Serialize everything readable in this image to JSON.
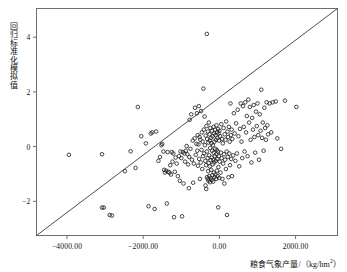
{
  "figure": {
    "background_color": "#ffffff",
    "frame_color": "#6f6f6f",
    "marker_color": "#1a1a1a",
    "line_color": "#3a3a3a"
  },
  "chart_data": {
    "type": "scatter",
    "title": "",
    "xlabel": "粮食气象产量/（kg/hm²）",
    "ylabel": "回归标准化模拟值",
    "xlim": [
      -4800,
      3100
    ],
    "ylim": [
      -3.25,
      5.05
    ],
    "grid": false,
    "legend": null,
    "xticks": [
      -4000,
      -2000,
      0,
      2000
    ],
    "xtick_labels": [
      "-4000.00",
      "-2000.00",
      "0.00",
      "2000.00"
    ],
    "yticks": [
      -2,
      0,
      2,
      4
    ],
    "ytick_labels": [
      "-2",
      "0",
      "2",
      "4"
    ],
    "reference_line": {
      "name": "1:1 diagonal reference line",
      "x": [
        -4800,
        3100
      ],
      "y": [
        -3.25,
        5.05
      ]
    },
    "marker": {
      "shape": "open-circle",
      "radius_px": 1.8,
      "stroke_width": 0.8
    },
    "points": [
      [
        -3950,
        -0.3
      ],
      [
        -3080,
        -0.28
      ],
      [
        -3080,
        -2.23
      ],
      [
        -3035,
        -2.23
      ],
      [
        -2880,
        -2.5
      ],
      [
        -2820,
        -2.52
      ],
      [
        -2480,
        -0.9
      ],
      [
        -2330,
        -0.17
      ],
      [
        -2200,
        -0.78
      ],
      [
        -2140,
        1.45
      ],
      [
        -2050,
        0.38
      ],
      [
        -1930,
        0.12
      ],
      [
        -1860,
        -2.18
      ],
      [
        -1800,
        0.48
      ],
      [
        -1760,
        0.52
      ],
      [
        -1700,
        -2.28
      ],
      [
        -1660,
        0.55
      ],
      [
        -1600,
        -0.52
      ],
      [
        -1560,
        -0.38
      ],
      [
        -1520,
        0.05
      ],
      [
        -1500,
        0.1
      ],
      [
        -1470,
        -0.18
      ],
      [
        -1450,
        -0.85
      ],
      [
        -1430,
        -0.95
      ],
      [
        -1400,
        -0.88
      ],
      [
        -1380,
        -2.08
      ],
      [
        -1360,
        -0.2
      ],
      [
        -1340,
        -0.92
      ],
      [
        -1310,
        -0.95
      ],
      [
        -1290,
        -0.68
      ],
      [
        -1270,
        -1.02
      ],
      [
        -1250,
        -0.2
      ],
      [
        -1230,
        -0.55
      ],
      [
        -1210,
        -0.25
      ],
      [
        -1190,
        -2.58
      ],
      [
        -1170,
        -0.92
      ],
      [
        -1150,
        -0.4
      ],
      [
        -1120,
        -0.62
      ],
      [
        -1090,
        -1.08
      ],
      [
        -1060,
        -0.35
      ],
      [
        -1040,
        -1.25
      ],
      [
        -1020,
        -0.18
      ],
      [
        -1000,
        -0.42
      ],
      [
        -980,
        -2.55
      ],
      [
        -960,
        -0.2
      ],
      [
        -940,
        -1.35
      ],
      [
        -920,
        -0.25
      ],
      [
        -900,
        -0.55
      ],
      [
        -880,
        -0.15
      ],
      [
        -860,
        0.02
      ],
      [
        -840,
        -0.28
      ],
      [
        -820,
        -0.65
      ],
      [
        -800,
        -1.52
      ],
      [
        -790,
        -0.38
      ],
      [
        -780,
        0.98
      ],
      [
        -760,
        -0.08
      ],
      [
        -740,
        1.18
      ],
      [
        -720,
        -0.48
      ],
      [
        -700,
        0.22
      ],
      [
        -690,
        -1.32
      ],
      [
        -670,
        -0.62
      ],
      [
        -650,
        0.3
      ],
      [
        -640,
        1.42
      ],
      [
        -620,
        -0.3
      ],
      [
        -600,
        0.1
      ],
      [
        -590,
        1.22
      ],
      [
        -580,
        -0.15
      ],
      [
        -570,
        0.42
      ],
      [
        -560,
        -0.7
      ],
      [
        -550,
        0.08
      ],
      [
        -540,
        1.48
      ],
      [
        -530,
        -0.45
      ],
      [
        -520,
        0.35
      ],
      [
        -510,
        -1.18
      ],
      [
        -500,
        0.25
      ],
      [
        -490,
        -0.58
      ],
      [
        -480,
        1.3
      ],
      [
        -470,
        -0.12
      ],
      [
        -460,
        0.52
      ],
      [
        -450,
        -0.82
      ],
      [
        -440,
        0.18
      ],
      [
        -430,
        -0.35
      ],
      [
        -420,
        2.12
      ],
      [
        -410,
        0.62
      ],
      [
        -400,
        -0.25
      ],
      [
        -390,
        1.1
      ],
      [
        -380,
        0.05
      ],
      [
        -370,
        -0.52
      ],
      [
        -365,
        -1.42
      ],
      [
        -360,
        0.4
      ],
      [
        -350,
        -0.68
      ],
      [
        -345,
        -1.55
      ],
      [
        -340,
        0.75
      ],
      [
        -330,
        -0.18
      ],
      [
        -325,
        -1.12
      ],
      [
        -320,
        0.28
      ],
      [
        -310,
        -0.42
      ],
      [
        -305,
        -1.18
      ],
      [
        -300,
        0.55
      ],
      [
        -295,
        -0.9
      ],
      [
        -290,
        0.15
      ],
      [
        -285,
        -1.25
      ],
      [
        -280,
        -0.6
      ],
      [
        -275,
        0.88
      ],
      [
        -270,
        -0.32
      ],
      [
        -265,
        -1.08
      ],
      [
        -260,
        0.45
      ],
      [
        -255,
        -0.72
      ],
      [
        -250,
        0.22
      ],
      [
        -245,
        -1.3
      ],
      [
        -240,
        -0.05
      ],
      [
        -235,
        0.68
      ],
      [
        -230,
        -0.5
      ],
      [
        -225,
        -1.15
      ],
      [
        -220,
        0.32
      ],
      [
        -215,
        -0.85
      ],
      [
        -210,
        0.12
      ],
      [
        -205,
        -1.22
      ],
      [
        -200,
        -0.4
      ],
      [
        -195,
        0.58
      ],
      [
        -190,
        -0.15
      ],
      [
        -185,
        -1.05
      ],
      [
        -180,
        0.38
      ],
      [
        -175,
        -0.65
      ],
      [
        -170,
        0.05
      ],
      [
        -165,
        -1.28
      ],
      [
        -160,
        -0.48
      ],
      [
        -155,
        0.72
      ],
      [
        -150,
        -0.22
      ],
      [
        -145,
        -0.95
      ],
      [
        -140,
        0.48
      ],
      [
        -135,
        -0.58
      ],
      [
        -130,
        0.18
      ],
      [
        -125,
        -1.12
      ],
      [
        -120,
        -0.35
      ],
      [
        -115,
        0.62
      ],
      [
        -110,
        -0.08
      ],
      [
        -105,
        -1.02
      ],
      [
        -100,
        0.42
      ],
      [
        -95,
        -0.52
      ],
      [
        -90,
        0.25
      ],
      [
        -85,
        -1.18
      ],
      [
        -80,
        -0.28
      ],
      [
        -75,
        0.78
      ],
      [
        -70,
        -0.12
      ],
      [
        -65,
        -0.88
      ],
      [
        -60,
        0.52
      ],
      [
        -55,
        -0.45
      ],
      [
        -50,
        0.32
      ],
      [
        -45,
        -1.08
      ],
      [
        -40,
        -0.18
      ],
      [
        -35,
        0.65
      ],
      [
        -30,
        -2.22
      ],
      [
        -25,
        -0.75
      ],
      [
        -20,
        0.48
      ],
      [
        -15,
        -0.35
      ],
      [
        -10,
        0.22
      ],
      [
        -5,
        -1.15
      ],
      [
        0,
        0.58
      ],
      [
        10,
        -0.55
      ],
      [
        20,
        0.38
      ],
      [
        30,
        -0.95
      ],
      [
        40,
        -0.22
      ],
      [
        50,
        0.82
      ],
      [
        60,
        -0.42
      ],
      [
        70,
        0.28
      ],
      [
        80,
        -1.18
      ],
      [
        90,
        0.12
      ],
      [
        100,
        -0.62
      ],
      [
        110,
        0.68
      ],
      [
        120,
        -0.28
      ],
      [
        130,
        -1.35
      ],
      [
        140,
        0.45
      ],
      [
        150,
        -0.48
      ],
      [
        160,
        0.25
      ],
      [
        170,
        -0.82
      ],
      [
        180,
        0.92
      ],
      [
        190,
        -0.18
      ],
      [
        200,
        -2.5
      ],
      [
        210,
        0.55
      ],
      [
        220,
        -0.38
      ],
      [
        230,
        0.35
      ],
      [
        240,
        -1.12
      ],
      [
        250,
        0.72
      ],
      [
        260,
        -0.25
      ],
      [
        270,
        0.18
      ],
      [
        280,
        -0.68
      ],
      [
        290,
        1.58
      ],
      [
        300,
        0.42
      ],
      [
        310,
        -0.45
      ],
      [
        320,
        0.62
      ],
      [
        330,
        -1.08
      ],
      [
        340,
        0.28
      ],
      [
        360,
        -0.32
      ],
      [
        380,
        1.22
      ],
      [
        400,
        0.48
      ],
      [
        420,
        -0.52
      ],
      [
        440,
        0.85
      ],
      [
        460,
        -0.25
      ],
      [
        480,
        1.35
      ],
      [
        500,
        0.38
      ],
      [
        520,
        -0.72
      ],
      [
        540,
        0.65
      ],
      [
        560,
        1.58
      ],
      [
        580,
        0.18
      ],
      [
        600,
        -0.42
      ],
      [
        620,
        1.48
      ],
      [
        640,
        0.72
      ],
      [
        660,
        -0.18
      ],
      [
        680,
        1.62
      ],
      [
        700,
        0.52
      ],
      [
        720,
        1.12
      ],
      [
        740,
        -0.35
      ],
      [
        760,
        1.72
      ],
      [
        780,
        0.88
      ],
      [
        800,
        1.45
      ],
      [
        820,
        0.25
      ],
      [
        840,
        -0.58
      ],
      [
        860,
        1.05
      ],
      [
        880,
        0.62
      ],
      [
        900,
        1.52
      ],
      [
        920,
        0.35
      ],
      [
        940,
        -0.22
      ],
      [
        960,
        1.28
      ],
      [
        980,
        0.75
      ],
      [
        1000,
        1.58
      ],
      [
        1020,
        0.42
      ],
      [
        1040,
        -0.48
      ],
      [
        1060,
        1.18
      ],
      [
        1080,
        0.58
      ],
      [
        1100,
        2.08
      ],
      [
        1120,
        0.32
      ],
      [
        1140,
        0.88
      ],
      [
        1160,
        -0.15
      ],
      [
        1180,
        1.42
      ],
      [
        1200,
        0.68
      ],
      [
        1220,
        0.25
      ],
      [
        1240,
        1.62
      ],
      [
        1260,
        0.78
      ],
      [
        1280,
        0.45
      ],
      [
        1320,
        1.58
      ],
      [
        1360,
        0.52
      ],
      [
        1400,
        1.62
      ],
      [
        1480,
        1.65
      ],
      [
        1520,
        0.3
      ],
      [
        1620,
        -0.08
      ],
      [
        1720,
        1.68
      ],
      [
        2020,
        1.45
      ],
      [
        -330,
        4.12
      ]
    ],
    "n_points": 232
  }
}
